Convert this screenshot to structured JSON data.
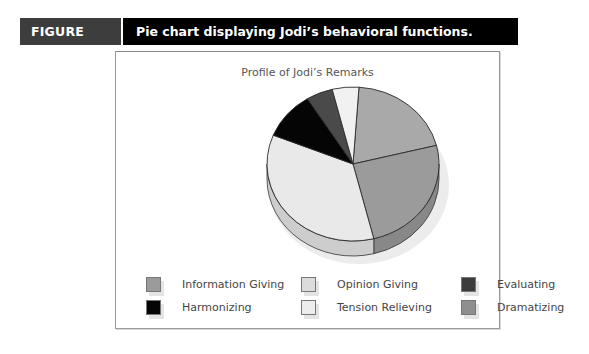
{
  "figure": {
    "label": "FIGURE 15.6",
    "caption": "Pie chart displaying Jodi’s behavioral functions."
  },
  "chart_data": {
    "type": "pie",
    "title": "Profile of Jodi’s Remarks",
    "style": "3d",
    "categories": [
      "Dramatizing",
      "Information Giving",
      "Opinion Giving",
      "Harmonizing",
      "Evaluating",
      "Tension Relieving"
    ],
    "values": [
      20,
      25,
      35,
      10,
      5,
      5
    ],
    "unit": "percent (estimated)",
    "colors": {
      "Dramatizing": "#a9a9a9",
      "Information Giving": "#9b9b9b",
      "Opinion Giving": "#e9e9e9",
      "Harmonizing": "#050505",
      "Evaluating": "#4a4a4a",
      "Tension Relieving": "#f1f1f1"
    },
    "start_angle_deg": 4,
    "direction": "clockwise",
    "legend_position": "bottom",
    "legend": [
      {
        "label": "Information Giving",
        "color": "#9b9b9b"
      },
      {
        "label": "Opinion Giving",
        "color": "#dcdcdc"
      },
      {
        "label": "Evaluating",
        "color": "#3c3c3c"
      },
      {
        "label": "Harmonizing",
        "color": "#050505"
      },
      {
        "label": "Tension Relieving",
        "color": "#ededed"
      },
      {
        "label": "Dramatizing",
        "color": "#8f8f8f"
      }
    ]
  }
}
